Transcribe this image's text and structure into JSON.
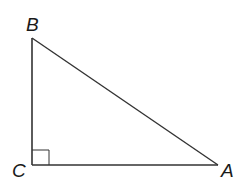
{
  "diagram": {
    "type": "right-triangle",
    "vertices": [
      {
        "label": "B",
        "x": 32,
        "y": 38
      },
      {
        "label": "C",
        "x": 32,
        "y": 165
      },
      {
        "label": "A",
        "x": 218,
        "y": 165
      }
    ],
    "right_angle_at": "C",
    "stroke_color": "#333333"
  },
  "labels": {
    "B": "B",
    "C": "C",
    "A": "A"
  }
}
